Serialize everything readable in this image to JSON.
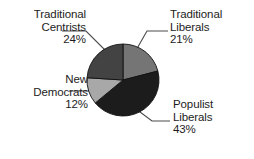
{
  "chart_data": {
    "type": "pie",
    "title": "",
    "subtitle": "",
    "xlabel": "",
    "ylabel": "",
    "grid": false,
    "legend_position": "callout-labels",
    "start_angle_deg": 0,
    "direction": "clockwise",
    "units": "percent",
    "categories": [
      "Traditional Liberals",
      "Populist Liberals",
      "New Democrats",
      "Traditional Centrists"
    ],
    "values": [
      21,
      43,
      12,
      24
    ],
    "colors": [
      "#757575",
      "#1c1c1c",
      "#a8a8a8",
      "#434343"
    ],
    "slices": [
      {
        "label": "Traditional Liberals",
        "value": 21,
        "value_text": "21%",
        "color": "#757575",
        "start_pct": 0,
        "end_pct": 21
      },
      {
        "label": "Populist Liberals",
        "value": 43,
        "value_text": "43%",
        "color": "#1c1c1c",
        "start_pct": 21,
        "end_pct": 64
      },
      {
        "label": "New Democrats",
        "value": 12,
        "value_text": "12%",
        "color": "#a8a8a8",
        "start_pct": 64,
        "end_pct": 76
      },
      {
        "label": "Traditional Centrists",
        "value": 24,
        "value_text": "24%",
        "color": "#434343",
        "start_pct": 76,
        "end_pct": 100
      }
    ]
  },
  "labels": {
    "traditional_centrists": {
      "line1": "Traditional",
      "line2": "Centrists",
      "value": "24%"
    },
    "traditional_liberals": {
      "line1": "Traditional",
      "line2": "Liberals",
      "value": "21%"
    },
    "new_democrats": {
      "line1": "New",
      "line2": "Democrats",
      "value": "12%"
    },
    "populist_liberals": {
      "line1": "Populist",
      "line2": "Liberals",
      "value": "43%"
    }
  },
  "style": {
    "background": "#ffffff",
    "text_color": "#1d1d1d",
    "leader_line_color": "#4a4a4a",
    "slice_border_color": "#111111"
  }
}
